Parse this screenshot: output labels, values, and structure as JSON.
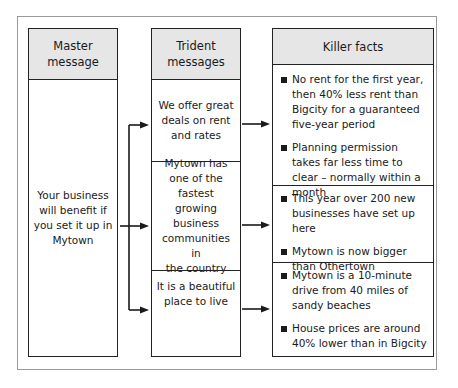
{
  "columns": {
    "master": {
      "header": [
        "Master",
        "message"
      ],
      "text": [
        "Your business",
        "will benefit if",
        "you set it up in",
        "Mytown"
      ]
    },
    "trident": {
      "header": [
        "Trident",
        "messages"
      ],
      "items": [
        {
          "lines": [
            "We offer great",
            "deals on rent",
            "and rates"
          ]
        },
        {
          "lines": [
            "Mytown has",
            "one of the",
            "fastest growing",
            "business",
            "communities in",
            "the country"
          ]
        },
        {
          "lines": [
            "It is a beautiful",
            "place to live"
          ]
        }
      ]
    },
    "killer": {
      "header": "Killer facts",
      "groups": [
        {
          "facts": [
            "No rent for the first year, then 40% less rent than Bigcity for a guaranteed five-year period",
            "Planning permission takes far less time to clear – normally within a month"
          ]
        },
        {
          "facts": [
            "This year over 200 new businesses have set up here",
            "Mytown is now bigger than Othertown"
          ]
        },
        {
          "facts": [
            "Mytown is a 10-minute drive from 40 miles of sandy beaches",
            "House prices are around 40% lower than in Bigcity"
          ]
        }
      ]
    }
  },
  "icons": {
    "bullet": "square-bullet-icon",
    "arrow": "right-arrow-icon"
  },
  "colors": {
    "header_bg": "#e6e6e6",
    "line": "#222222",
    "frame": "#9a9a9a"
  }
}
